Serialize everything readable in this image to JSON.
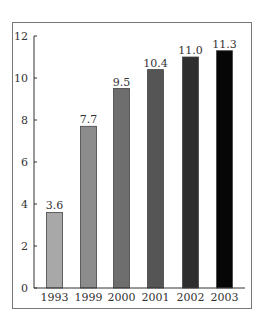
{
  "chart_data": {
    "type": "bar",
    "title": "",
    "xlabel": "",
    "ylabel": "",
    "categories": [
      "1993",
      "1999",
      "2000",
      "2001",
      "2002",
      "2003"
    ],
    "values": [
      3.6,
      7.7,
      9.5,
      10.4,
      11.0,
      11.3
    ],
    "value_labels": [
      "3.6",
      "7.7",
      "9.5",
      "10.4",
      "11.0",
      "11.3"
    ],
    "colors": [
      "#a8a8a8",
      "#8c8c8c",
      "#6e6e6e",
      "#555555",
      "#2e2e2e",
      "#060606"
    ],
    "ylim": [
      0,
      12
    ],
    "yticks": [
      0,
      2,
      4,
      6,
      8,
      10,
      12
    ],
    "grid": false,
    "legend": "none"
  }
}
